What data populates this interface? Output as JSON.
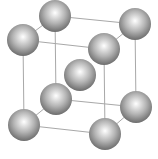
{
  "diagram": {
    "type": "crystal-lattice",
    "structure": "body-centered cubic",
    "colors": {
      "background": "#ffffff",
      "edge": "#a8a8a8",
      "sphere_highlight": "#ffffff",
      "sphere_mid": "#b4b4b4",
      "sphere_edge": "#6c6c6c"
    },
    "sphere_radius": 16,
    "atoms": [
      {
        "id": "top-back-left",
        "x": 55,
        "y": 16
      },
      {
        "id": "top-back-right",
        "x": 135,
        "y": 24
      },
      {
        "id": "top-front-left",
        "x": 23,
        "y": 40
      },
      {
        "id": "top-front-right",
        "x": 104,
        "y": 49
      },
      {
        "id": "body-center",
        "x": 80,
        "y": 75
      },
      {
        "id": "bottom-back-left",
        "x": 56,
        "y": 99
      },
      {
        "id": "bottom-back-right",
        "x": 136,
        "y": 107
      },
      {
        "id": "bottom-front-left",
        "x": 24,
        "y": 125
      },
      {
        "id": "bottom-front-right",
        "x": 105,
        "y": 134
      }
    ],
    "edges": [
      [
        "top-back-left",
        "top-back-right"
      ],
      [
        "top-back-left",
        "top-front-left"
      ],
      [
        "top-back-right",
        "top-front-right"
      ],
      [
        "top-front-left",
        "top-front-right"
      ],
      [
        "bottom-back-left",
        "bottom-back-right"
      ],
      [
        "bottom-back-left",
        "bottom-front-left"
      ],
      [
        "bottom-back-right",
        "bottom-front-right"
      ],
      [
        "bottom-front-left",
        "bottom-front-right"
      ],
      [
        "top-back-left",
        "bottom-back-left"
      ],
      [
        "top-back-right",
        "bottom-back-right"
      ],
      [
        "top-front-left",
        "bottom-front-left"
      ],
      [
        "top-front-right",
        "bottom-front-right"
      ]
    ]
  }
}
